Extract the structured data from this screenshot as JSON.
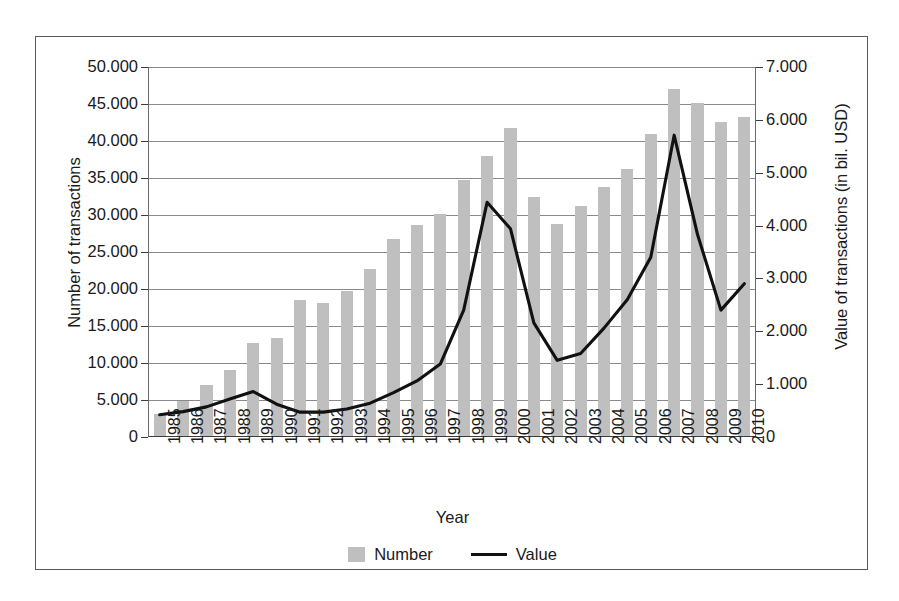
{
  "chart_data": {
    "type": "bar",
    "title": "",
    "xlabel": "Year",
    "ylabel": "Number of transactions",
    "y2label": "Value of transactions (in bil. USD)",
    "categories": [
      "1985",
      "1986",
      "1987",
      "1988",
      "1989",
      "1990",
      "1991",
      "1992",
      "1993",
      "1994",
      "1995",
      "1996",
      "1997",
      "1998",
      "1999",
      "2000",
      "2001",
      "2002",
      "2003",
      "2004",
      "2005",
      "2006",
      "2007",
      "2008",
      "2009",
      "2010"
    ],
    "ylim": [
      0,
      50000
    ],
    "y2lim": [
      0,
      7000
    ],
    "yticks": [
      0,
      5000,
      10000,
      15000,
      20000,
      25000,
      30000,
      35000,
      40000,
      45000,
      50000
    ],
    "ytick_labels": [
      "0",
      "5.000",
      "10.000",
      "15.000",
      "20.000",
      "25.000",
      "30.000",
      "35.000",
      "40.000",
      "45.000",
      "50.000"
    ],
    "y2ticks": [
      0,
      1000,
      2000,
      3000,
      4000,
      5000,
      6000,
      7000
    ],
    "y2tick_labels": [
      "0",
      "1.000",
      "2.000",
      "3.000",
      "4.000",
      "5.000",
      "6.000",
      "7.000"
    ],
    "grid": true,
    "legend_position": "bottom",
    "series": [
      {
        "name": "Number",
        "type": "bar",
        "axis": "left",
        "color": "#bfbfbf",
        "values": [
          3100,
          4900,
          7000,
          9100,
          12700,
          13400,
          18500,
          18100,
          19700,
          22700,
          26700,
          28600,
          30200,
          34700,
          38000,
          41700,
          32500,
          28800,
          31200,
          33800,
          36200,
          41000,
          47000,
          45200,
          42600,
          43300
        ]
      },
      {
        "name": "Value",
        "type": "line",
        "axis": "right",
        "color": "#111111",
        "values": [
          420,
          480,
          570,
          720,
          860,
          620,
          470,
          470,
          530,
          640,
          840,
          1060,
          1380,
          2400,
          4440,
          3940,
          2160,
          1450,
          1580,
          2060,
          2600,
          3400,
          5710,
          3830,
          2400,
          2900
        ]
      }
    ]
  },
  "legend": {
    "items": [
      {
        "label": "Number",
        "marker": "bar-swatch"
      },
      {
        "label": "Value",
        "marker": "line-swatch"
      }
    ]
  }
}
